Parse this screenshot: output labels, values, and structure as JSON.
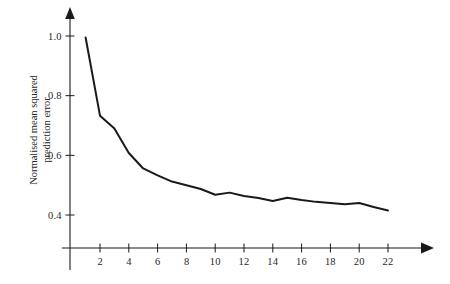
{
  "chart_data": {
    "type": "line",
    "title": "",
    "xlabel": "",
    "ylabel": "Normalised mean squared prediction error",
    "ylabel_lines": [
      "Normalised mean squared",
      "prediction error"
    ],
    "xlim": [
      0,
      25
    ],
    "ylim": [
      0.3,
      1.08
    ],
    "grid": false,
    "legend": null,
    "axis_style": "arrow-tipped L axes",
    "xticks": [
      2,
      4,
      6,
      8,
      10,
      12,
      14,
      16,
      18,
      20,
      22
    ],
    "xtick_labels": [
      "2",
      "4",
      "6",
      "8",
      "10",
      "12",
      "14",
      "16",
      "18",
      "20",
      "22"
    ],
    "yticks": [
      0.4,
      0.6,
      0.8,
      1.0
    ],
    "ytick_labels": [
      "0.4",
      "0.6",
      "0.8",
      "1.0"
    ],
    "series": [
      {
        "name": "Normalised mean squared prediction error",
        "color": "#1a1a1a",
        "x": [
          1,
          2,
          3,
          4,
          5,
          6,
          7,
          8,
          9,
          10,
          11,
          12,
          13,
          14,
          15,
          16,
          17,
          18,
          19,
          20,
          21,
          22
        ],
        "values": [
          0.995,
          0.733,
          0.69,
          0.608,
          0.556,
          0.533,
          0.512,
          0.5,
          0.487,
          0.468,
          0.475,
          0.464,
          0.457,
          0.447,
          0.458,
          0.45,
          0.444,
          0.44,
          0.436,
          0.44,
          0.427,
          0.415
        ]
      }
    ]
  }
}
